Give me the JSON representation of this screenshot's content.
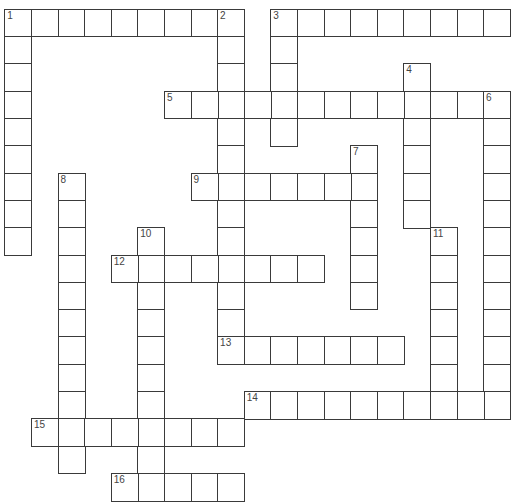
{
  "puzzle": {
    "type": "crossword",
    "grid": {
      "cols": 19,
      "rows": 18,
      "origin_x": 5,
      "origin_y": 9.5,
      "cell_w": 26.6,
      "cell_h": 27.3
    },
    "line_color": "#3a3a3a",
    "number_color": "#444444",
    "words": [
      {
        "number": 1,
        "direction": "across",
        "col": 0,
        "row": 0,
        "length": 9
      },
      {
        "number": 1,
        "direction": "down",
        "col": 0,
        "row": 0,
        "length": 9
      },
      {
        "number": 2,
        "direction": "down",
        "col": 8,
        "row": 0,
        "length": 13
      },
      {
        "number": 3,
        "direction": "across",
        "col": 10,
        "row": 0,
        "length": 9
      },
      {
        "number": 3,
        "direction": "down",
        "col": 10,
        "row": 0,
        "length": 5
      },
      {
        "number": 4,
        "direction": "down",
        "col": 15,
        "row": 2,
        "length": 6
      },
      {
        "number": 5,
        "direction": "across",
        "col": 6,
        "row": 3,
        "length": 13
      },
      {
        "number": 6,
        "direction": "down",
        "col": 18,
        "row": 3,
        "length": 12
      },
      {
        "number": 7,
        "direction": "down",
        "col": 13,
        "row": 5,
        "length": 6
      },
      {
        "number": 8,
        "direction": "down",
        "col": 2,
        "row": 6,
        "length": 11
      },
      {
        "number": 9,
        "direction": "across",
        "col": 7,
        "row": 6,
        "length": 7
      },
      {
        "number": 10,
        "direction": "down",
        "col": 5,
        "row": 8,
        "length": 10
      },
      {
        "number": 11,
        "direction": "down",
        "col": 16,
        "row": 8,
        "length": 7
      },
      {
        "number": 12,
        "direction": "across",
        "col": 4,
        "row": 9,
        "length": 8
      },
      {
        "number": 13,
        "direction": "across",
        "col": 8,
        "row": 12,
        "length": 7
      },
      {
        "number": 14,
        "direction": "across",
        "col": 9,
        "row": 14,
        "length": 10
      },
      {
        "number": 15,
        "direction": "across",
        "col": 1,
        "row": 15,
        "length": 8
      },
      {
        "number": 16,
        "direction": "across",
        "col": 4,
        "row": 17,
        "length": 5
      }
    ]
  }
}
